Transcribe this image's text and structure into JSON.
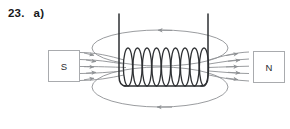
{
  "figure": {
    "question_number": "23.",
    "part_label": "a)",
    "type": "physics-diagram",
    "colors": {
      "background": "#ffffff",
      "text": "#17181a",
      "coil_wire": "#2e3033",
      "field_line": "#8e9194",
      "pole_box_border": "#a9abae",
      "pole_label": "#2a2c2e"
    }
  },
  "poles": {
    "south": {
      "label": "S",
      "side": "left"
    },
    "north": {
      "label": "N",
      "side": "right"
    }
  },
  "solenoid": {
    "turns": 9,
    "coil_left_x": 128,
    "coil_right_x": 204,
    "coil_top_y": 48,
    "coil_bottom_y": 86,
    "lead_left_x": 119,
    "lead_right_x": 208,
    "lead_top_y": 14,
    "loop_half_width": 4.6
  },
  "field_lines": {
    "top_ellipse": {
      "cx": 160,
      "cy": 48,
      "rx": 68,
      "ry": 18,
      "arrow_direction": "left"
    },
    "bottom_ellipse": {
      "cx": 160,
      "cy": 87,
      "rx": 68,
      "ry": 20,
      "arrow_direction": "left"
    },
    "left_straight_count": 5,
    "right_straight_count": 5,
    "left_arrow_direction": "right",
    "right_arrow_direction": "right"
  }
}
